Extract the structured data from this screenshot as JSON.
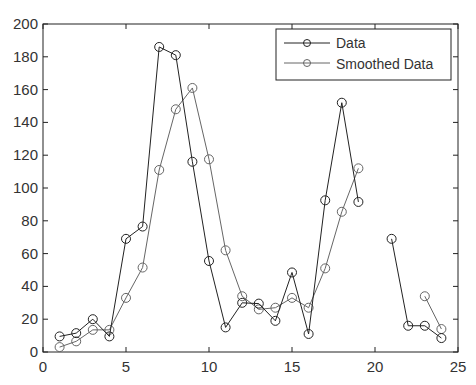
{
  "chart_data": {
    "type": "line",
    "title": "",
    "xlabel": "",
    "ylabel": "",
    "xlim": [
      0,
      25
    ],
    "ylim": [
      0,
      200
    ],
    "xticks": [
      0,
      5,
      10,
      15,
      20,
      25
    ],
    "yticks": [
      0,
      20,
      40,
      60,
      80,
      100,
      120,
      140,
      160,
      180,
      200
    ],
    "grid": false,
    "legend_position": "upper right",
    "series": [
      {
        "name": "Data",
        "color": "#222222",
        "marker": "circle",
        "segments": [
          {
            "x": [
              1,
              2,
              3,
              4,
              5,
              6,
              7,
              8,
              9,
              10,
              11,
              12,
              13,
              14,
              15,
              16,
              17,
              18,
              19
            ],
            "y": [
              9.5,
              11.5,
              20,
              9.5,
              69,
              76.5,
              186,
              181,
              116,
              55.5,
              15,
              30,
              29.5,
              19,
              48.5,
              11,
              92.5,
              152,
              91.5
            ]
          },
          {
            "x": [
              21,
              22,
              23,
              24
            ],
            "y": [
              69,
              16,
              16,
              8.5
            ]
          }
        ]
      },
      {
        "name": "Smoothed Data",
        "color": "#666666",
        "marker": "circle",
        "segments": [
          {
            "x": [
              1,
              2,
              3,
              4,
              5,
              6,
              7,
              8,
              9,
              10,
              11,
              12,
              13,
              14,
              15,
              16,
              17,
              18,
              19
            ],
            "y": [
              3,
              6.5,
              13.5,
              13.5,
              33,
              51.5,
              111,
              148,
              161,
              117.5,
              62,
              34,
              26,
              27,
              33,
              27,
              51,
              85.5,
              112
            ]
          },
          {
            "x": [
              23,
              24
            ],
            "y": [
              34,
              14
            ]
          }
        ]
      }
    ]
  },
  "legend": {
    "items": [
      {
        "label": "Data",
        "color": "#222222"
      },
      {
        "label": "Smoothed Data",
        "color": "#666666"
      }
    ]
  }
}
